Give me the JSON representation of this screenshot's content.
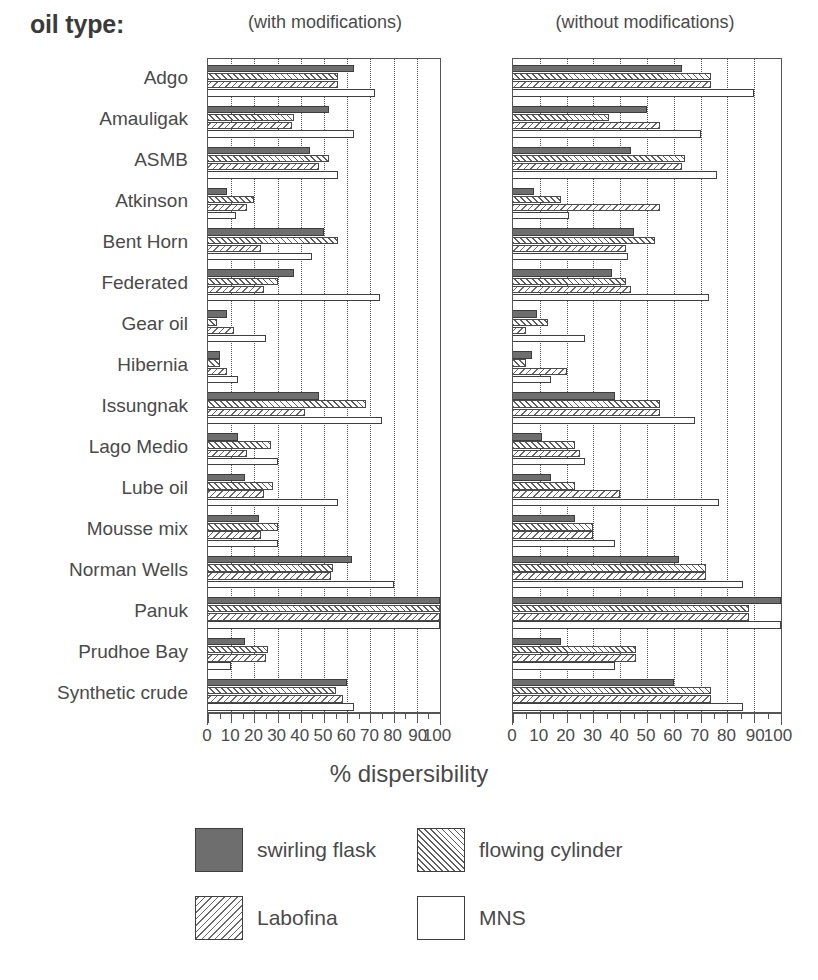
{
  "header": {
    "oil_type_label": "oil type:",
    "panel_left_caption": "(with modifications)",
    "panel_right_caption": "(without modifications)"
  },
  "axis": {
    "x_title": "% dispersibility",
    "tick_labels": [
      "0",
      "10",
      "20",
      "30",
      "40",
      "50",
      "60",
      "70",
      "80",
      "90",
      "100"
    ]
  },
  "legend": {
    "items": [
      {
        "label": "swirling flask",
        "pattern": "solid-dark",
        "swatch_color": "#6e6e6e"
      },
      {
        "label": "flowing cylinder",
        "pattern": "hatch-45",
        "swatch_color": "#5f5f5f"
      },
      {
        "label": "Labofina",
        "pattern": "hatch-135",
        "swatch_color": "#6a6a6a"
      },
      {
        "label": "MNS",
        "pattern": "open",
        "swatch_color": "#ffffff"
      }
    ]
  },
  "chart_data": {
    "type": "bar",
    "title": "oil type:",
    "xlabel": "% dispersibility",
    "ylabel": "oil type",
    "xlim": [
      0,
      100
    ],
    "grid": true,
    "orientation": "horizontal",
    "legend_position": "bottom",
    "panels": [
      {
        "name": "with modifications"
      },
      {
        "name": "without modifications"
      }
    ],
    "categories": [
      "Adgo",
      "Amauligak",
      "ASMB",
      "Atkinson",
      "Bent Horn",
      "Federated",
      "Gear oil",
      "Hibernia",
      "Issungnak",
      "Lago Medio",
      "Lube oil",
      "Mousse mix",
      "Norman Wells",
      "Panuk",
      "Prudhoe Bay",
      "Synthetic crude"
    ],
    "series_names": [
      "swirling flask",
      "flowing cylinder",
      "Labofina",
      "MNS"
    ],
    "with_modifications": {
      "swirling flask": [
        63,
        52,
        44,
        8,
        50,
        37,
        8,
        5,
        48,
        13,
        16,
        22,
        62,
        100,
        16,
        60
      ],
      "flowing cylinder": [
        56,
        37,
        52,
        20,
        56,
        30,
        4,
        5,
        68,
        27,
        28,
        30,
        54,
        100,
        26,
        55
      ],
      "Labofina": [
        56,
        36,
        48,
        17,
        23,
        24,
        11,
        8,
        42,
        17,
        24,
        23,
        53,
        100,
        25,
        58
      ],
      "MNS": [
        72,
        63,
        56,
        12,
        45,
        74,
        25,
        13,
        75,
        30,
        56,
        30,
        80,
        100,
        10,
        63
      ]
    },
    "without_modifications": {
      "swirling flask": [
        63,
        50,
        44,
        8,
        45,
        37,
        9,
        7,
        38,
        11,
        14,
        23,
        62,
        100,
        18,
        60
      ],
      "flowing cylinder": [
        74,
        36,
        64,
        18,
        53,
        42,
        13,
        5,
        55,
        23,
        23,
        30,
        72,
        88,
        46,
        74
      ],
      "Labofina": [
        74,
        55,
        63,
        55,
        42,
        44,
        5,
        20,
        55,
        25,
        40,
        30,
        72,
        88,
        46,
        74
      ],
      "MNS": [
        90,
        70,
        76,
        21,
        43,
        73,
        27,
        14,
        68,
        27,
        77,
        38,
        86,
        100,
        38,
        86
      ]
    }
  }
}
